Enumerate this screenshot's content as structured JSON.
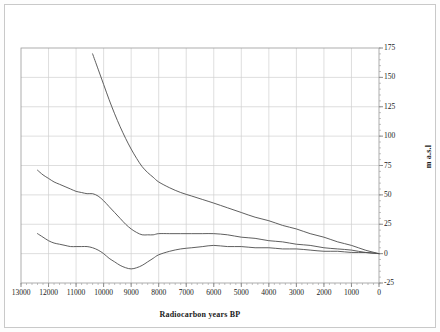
{
  "chart_data": {
    "type": "line",
    "title": "",
    "xlabel": "Radiocarbon years BP",
    "ylabel": "m a.s.l",
    "xlim": [
      13000,
      0
    ],
    "ylim": [
      -25,
      175
    ],
    "x_reversed": true,
    "grid": true,
    "legend": "none",
    "xticks": [
      "13000",
      "12000",
      "11000",
      "10000",
      "9000",
      "8000",
      "7000",
      "6000",
      "5000",
      "4000",
      "3000",
      "2000",
      "1000",
      "0"
    ],
    "xtick_values": [
      13000,
      12000,
      11000,
      10000,
      9000,
      8000,
      7000,
      6000,
      5000,
      4000,
      3000,
      2000,
      1000,
      0
    ],
    "yticks": [
      "175",
      "150",
      "125",
      "100",
      "75",
      "50",
      "25",
      "0",
      "-25"
    ],
    "ytick_values": [
      175,
      150,
      125,
      100,
      75,
      50,
      25,
      0,
      -25
    ],
    "series": [
      {
        "name": "upper-shoreline",
        "x": [
          10400,
          10200,
          10000,
          9800,
          9600,
          9400,
          9200,
          9000,
          8800,
          8600,
          8400,
          8200,
          8000,
          7600,
          7200,
          6800,
          6400,
          6000,
          5500,
          5000,
          4500,
          4000,
          3500,
          3000,
          2500,
          2000,
          1500,
          1000,
          500,
          0
        ],
        "values": [
          170,
          157,
          144,
          131,
          119,
          108,
          98,
          89,
          81,
          74,
          69,
          65,
          61,
          56,
          52,
          49,
          46,
          43,
          39,
          35,
          31,
          28,
          24,
          21,
          17,
          14,
          10,
          7,
          3,
          0
        ]
      },
      {
        "name": "middle-shoreline",
        "x": [
          12400,
          12200,
          12000,
          11800,
          11600,
          11400,
          11200,
          11000,
          10800,
          10600,
          10400,
          10200,
          10000,
          9800,
          9600,
          9400,
          9200,
          9000,
          8800,
          8600,
          8400,
          8200,
          8000,
          7600,
          7200,
          6800,
          6400,
          6000,
          5500,
          5000,
          4500,
          4000,
          3500,
          3000,
          2500,
          2000,
          1500,
          1000,
          500,
          0
        ],
        "values": [
          71,
          67,
          64,
          61,
          59,
          57,
          55,
          53,
          52,
          51,
          51,
          49,
          45,
          40,
          35,
          30,
          25,
          21,
          18,
          16,
          16,
          16,
          17,
          17,
          17,
          17,
          17,
          17,
          16,
          14,
          13,
          11,
          10,
          8,
          7,
          5,
          4,
          3,
          1,
          0
        ]
      },
      {
        "name": "lower-shoreline",
        "x": [
          12400,
          12200,
          12000,
          11800,
          11600,
          11400,
          11200,
          11000,
          10800,
          10600,
          10400,
          10200,
          10000,
          9800,
          9600,
          9400,
          9200,
          9000,
          8800,
          8600,
          8400,
          8200,
          8000,
          7600,
          7200,
          6800,
          6400,
          6000,
          5500,
          5000,
          4500,
          4000,
          3500,
          3000,
          2500,
          2000,
          1500,
          1000,
          500,
          0
        ],
        "values": [
          17,
          14,
          11,
          9,
          8,
          7,
          6,
          6,
          6,
          6,
          5,
          3,
          0,
          -4,
          -7,
          -10,
          -12,
          -13,
          -12,
          -10,
          -7,
          -4,
          -1,
          2,
          4,
          5,
          6,
          7,
          6,
          6,
          5,
          5,
          4,
          4,
          3,
          2,
          2,
          1,
          1,
          0
        ]
      }
    ]
  }
}
